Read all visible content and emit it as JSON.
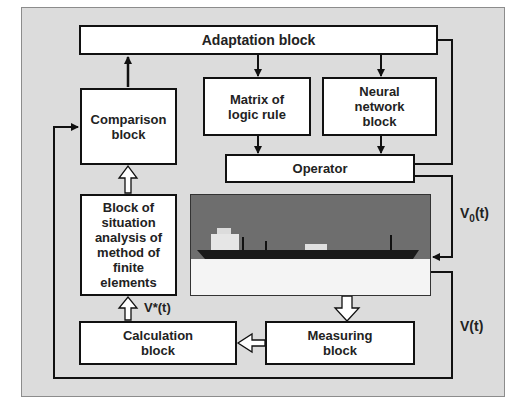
{
  "diagram": {
    "blocks": {
      "adaptation": "Adaptation block",
      "comparison": "Comparison block",
      "matrix": "Matrix of logic rule",
      "neural": "Neural network block",
      "operator": "Operator",
      "situation": "Block of situation analysis of method of finite elements",
      "calculation": "Calculation block",
      "measuring": "Measuring block"
    },
    "signals": {
      "v0": "V",
      "v0_sub": "0",
      "v0_suffix": "(t)",
      "v": "V(t)",
      "vstar": "V*(t)"
    },
    "image": {
      "subject": "ship-on-water"
    },
    "colors": {
      "panel": "#dcdcdc",
      "block": "#ffffff",
      "line": "#111111",
      "sky": "#6e6e6e"
    }
  }
}
